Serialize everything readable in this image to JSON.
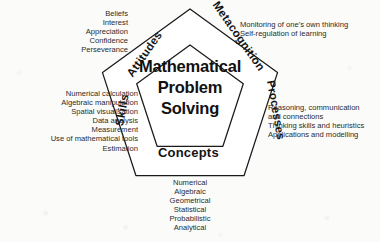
{
  "diagram": {
    "title": "Mathematical Problem Solving",
    "centre_lines": [
      "Mathematical",
      "Problem",
      "Solving"
    ],
    "shape": "double-pentagon",
    "colors": {
      "background": "#fbfbf9",
      "outline": "#1a1a1a",
      "text": "#1a1a1a"
    },
    "edge_labels": {
      "attitudes": "Attitudes",
      "metacognition": "Metacognition",
      "skills": "Skills",
      "processes": "Processes",
      "concepts": "Concepts"
    },
    "descriptors": {
      "attitudes": [
        "Beliefs",
        "Interest",
        "Appreciation",
        "Confidence",
        "Perseverance"
      ],
      "metacognition": [
        "Monitoring of one's own thinking",
        "Self-regulation of learning"
      ],
      "skills": [
        "Numerical calculation",
        "Algebraic manipulation",
        "Spatial visualisation",
        "Data analysis",
        "Measurement",
        "Use of mathematical tools",
        "Estimation"
      ],
      "processes": [
        "Reasoning, communication",
        "and connections",
        "Thinking skills and heuristics",
        "Applications and modelling"
      ],
      "concepts": [
        "Numerical",
        "Algebraic",
        "Geometrical",
        "Statistical",
        "Probabilistic",
        "Analytical"
      ]
    }
  }
}
